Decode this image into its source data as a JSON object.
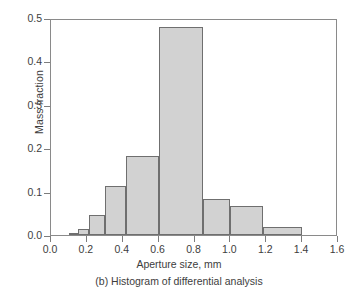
{
  "chart_data": {
    "type": "bar",
    "title": "",
    "caption": "(b) Histogram of differential analysis",
    "xlabel": "Aperture size, mm",
    "ylabel": "Mass fraction",
    "xlim": [
      0.0,
      1.6
    ],
    "ylim": [
      0.0,
      0.5
    ],
    "grid": false,
    "legend": false,
    "xticks": [
      "0.0",
      "0.2",
      "0.4",
      "0.6",
      "0.8",
      "1.0",
      "1.2",
      "1.4",
      "1.6"
    ],
    "xtick_values": [
      0.0,
      0.2,
      0.4,
      0.6,
      0.8,
      1.0,
      1.2,
      1.4,
      1.6
    ],
    "yticks": [
      "0.0",
      "0.1",
      "0.2",
      "0.3",
      "0.4",
      "0.5"
    ],
    "ytick_values": [
      0.0,
      0.1,
      0.2,
      0.3,
      0.4,
      0.5
    ],
    "bin_edges": [
      0.1,
      0.15,
      0.21,
      0.3,
      0.42,
      0.6,
      0.85,
      1.0,
      1.18,
      1.4
    ],
    "bins": [
      {
        "left": 0.1,
        "right": 0.15,
        "value": 0.005
      },
      {
        "left": 0.15,
        "right": 0.21,
        "value": 0.015
      },
      {
        "left": 0.21,
        "right": 0.3,
        "value": 0.047
      },
      {
        "left": 0.3,
        "right": 0.42,
        "value": 0.112
      },
      {
        "left": 0.42,
        "right": 0.6,
        "value": 0.183
      },
      {
        "left": 0.6,
        "right": 0.85,
        "value": 0.48
      },
      {
        "left": 0.85,
        "right": 1.0,
        "value": 0.083
      },
      {
        "left": 1.0,
        "right": 1.18,
        "value": 0.068
      },
      {
        "left": 1.18,
        "right": 1.4,
        "value": 0.018
      }
    ],
    "values": [
      0.005,
      0.015,
      0.047,
      0.112,
      0.183,
      0.48,
      0.083,
      0.068,
      0.018
    ],
    "categories": [
      "0.10-0.15",
      "0.15-0.21",
      "0.21-0.30",
      "0.30-0.42",
      "0.42-0.60",
      "0.60-0.85",
      "0.85-1.00",
      "1.00-1.18",
      "1.18-1.40"
    ],
    "colors": {
      "bar_fill": "#d2d2d2",
      "bar_edge": "#6f6f6f",
      "axis": "#8a8a8a",
      "text": "#3d3d3d",
      "background": "#ffffff"
    }
  }
}
